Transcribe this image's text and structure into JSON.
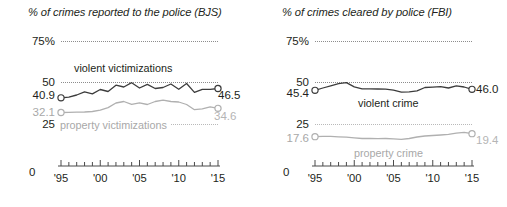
{
  "figure": {
    "width": 507,
    "height": 207,
    "background": "#ffffff",
    "accent_dark": "#3c3c3c",
    "accent_gray": "#b0b0b0"
  },
  "chart_data": [
    {
      "type": "line",
      "panel": "left",
      "title": "% of crimes reported to the police (BJS)",
      "xlabel": "",
      "ylabel": "",
      "ylim": [
        0,
        80
      ],
      "yticks": [
        0,
        25,
        50,
        75
      ],
      "ytick_labels": [
        "0",
        "25",
        "50",
        "75%"
      ],
      "grid": true,
      "legend": "inline-annotations",
      "xlim": [
        1995,
        2015
      ],
      "xticks": [
        1995,
        1996,
        1997,
        1998,
        1999,
        2000,
        2001,
        2002,
        2003,
        2004,
        2005,
        2006,
        2007,
        2008,
        2009,
        2010,
        2011,
        2012,
        2013,
        2014,
        2015
      ],
      "xtick_labels": [
        "'95",
        "'00",
        "'05",
        "'10",
        "'15"
      ],
      "xtick_label_years": [
        1995,
        2000,
        2005,
        2010,
        2015
      ],
      "series": [
        {
          "name": "violent victimizations",
          "color": "#3c3c3c",
          "start_label": "40.9",
          "end_label": "46.5",
          "x": [
            1995,
            1996,
            1997,
            1998,
            1999,
            2000,
            2001,
            2002,
            2003,
            2004,
            2005,
            2006,
            2007,
            2008,
            2009,
            2010,
            2011,
            2012,
            2013,
            2014,
            2015
          ],
          "values": [
            40.9,
            41.3,
            42.6,
            44.5,
            43.3,
            45.9,
            44.7,
            48.5,
            47.4,
            50.0,
            46.8,
            49.0,
            46.5,
            47.1,
            49.2,
            46.0,
            49.5,
            44.2,
            46.0,
            46.0,
            46.5
          ]
        },
        {
          "name": "property victimizations",
          "color": "#b0b0b0",
          "start_label": "32.1",
          "end_label": "34.6",
          "x": [
            1995,
            1996,
            1997,
            1998,
            1999,
            2000,
            2001,
            2002,
            2003,
            2004,
            2005,
            2006,
            2007,
            2008,
            2009,
            2010,
            2011,
            2012,
            2013,
            2014,
            2015
          ],
          "values": [
            32.1,
            32.2,
            32.3,
            32.4,
            32.7,
            33.5,
            35.0,
            37.8,
            38.7,
            37.0,
            37.9,
            36.9,
            38.7,
            39.5,
            38.7,
            38.4,
            36.9,
            33.8,
            34.3,
            35.5,
            34.6
          ]
        }
      ]
    },
    {
      "type": "line",
      "panel": "right",
      "title": "% of crimes cleared by police (FBI)",
      "xlabel": "",
      "ylabel": "",
      "ylim": [
        0,
        80
      ],
      "yticks": [
        0,
        25,
        50,
        75
      ],
      "ytick_labels": [
        "0",
        "25",
        "50",
        "75%"
      ],
      "grid": true,
      "legend": "inline-annotations",
      "xlim": [
        1995,
        2015
      ],
      "xticks": [
        1995,
        1996,
        1997,
        1998,
        1999,
        2000,
        2001,
        2002,
        2003,
        2004,
        2005,
        2006,
        2007,
        2008,
        2009,
        2010,
        2011,
        2012,
        2013,
        2014,
        2015
      ],
      "xtick_labels": [
        "'95",
        "'00",
        "'05",
        "'10",
        "'15"
      ],
      "xtick_label_years": [
        1995,
        2000,
        2005,
        2010,
        2015
      ],
      "series": [
        {
          "name": "violent crime",
          "color": "#3c3c3c",
          "start_label": "45.4",
          "end_label": "46.0",
          "x": [
            1995,
            1996,
            1997,
            1998,
            1999,
            2000,
            2001,
            2002,
            2003,
            2004,
            2005,
            2006,
            2007,
            2008,
            2009,
            2010,
            2011,
            2012,
            2013,
            2014,
            2015
          ],
          "values": [
            45.4,
            46.8,
            48.1,
            49.4,
            50.0,
            47.5,
            46.3,
            46.3,
            46.2,
            46.1,
            45.5,
            44.3,
            44.5,
            45.1,
            47.1,
            47.3,
            47.6,
            46.8,
            48.1,
            47.4,
            46.0
          ]
        },
        {
          "name": "property crime",
          "color": "#b0b0b0",
          "start_label": "17.6",
          "end_label": "19.4",
          "x": [
            1995,
            1996,
            1997,
            1998,
            1999,
            2000,
            2001,
            2002,
            2003,
            2004,
            2005,
            2006,
            2007,
            2008,
            2009,
            2010,
            2011,
            2012,
            2013,
            2014,
            2015
          ],
          "values": [
            17.6,
            17.8,
            17.8,
            17.5,
            17.3,
            16.9,
            16.5,
            16.5,
            16.4,
            16.5,
            16.3,
            16.0,
            16.5,
            17.4,
            18.0,
            18.3,
            18.6,
            19.0,
            19.7,
            20.2,
            19.4
          ]
        }
      ]
    }
  ]
}
